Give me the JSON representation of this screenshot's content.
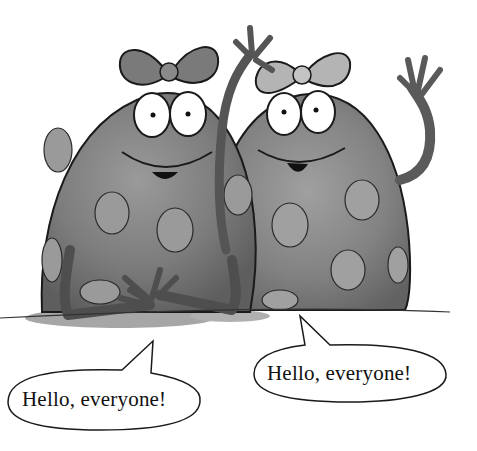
{
  "scene": {
    "description": "Two spotted blob characters with bows, one waving, greeting with speech bubbles",
    "colors": {
      "background": "#ffffff",
      "body_dark": "#6e6e6e",
      "body_mid": "#8a8a8a",
      "spots": "#9a9a9a",
      "bow_left": "#7a7a7a",
      "bow_right": "#b4b4b4",
      "outline": "#1a1a1a",
      "shadow": "#9c9c9c"
    }
  },
  "characters": [
    {
      "name": "left-blob",
      "bow": "dark bow",
      "pose": "hands clasped"
    },
    {
      "name": "right-blob",
      "bow": "light bow",
      "pose": "waving"
    }
  ],
  "speech_bubbles": [
    {
      "id": "left",
      "text": "Hello, everyone!"
    },
    {
      "id": "right",
      "text": "Hello, everyone!"
    }
  ]
}
